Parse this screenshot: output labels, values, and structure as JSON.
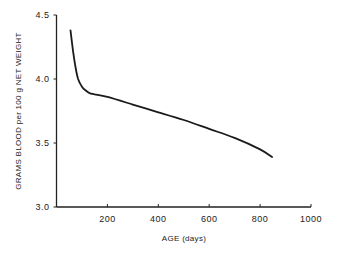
{
  "chart_data": {
    "type": "line",
    "title": "",
    "xlabel": "AGE (days)",
    "ylabel": "GRAMS BLOOD per 100 g   NET WEIGHT",
    "xlim": [
      0,
      1000
    ],
    "ylim": [
      3.0,
      4.5
    ],
    "x_ticks": [
      200,
      400,
      600,
      800,
      1000
    ],
    "x_tick_labels": [
      "200",
      "400",
      "600",
      "800",
      "1000"
    ],
    "y_ticks": [
      3.0,
      3.5,
      4.0,
      4.5
    ],
    "y_tick_labels": [
      "3.0",
      "3.5",
      "4.0",
      "4.5"
    ],
    "grid": false,
    "legend": null,
    "series": [
      {
        "name": "Blood volume",
        "x": [
          55,
          65,
          75,
          85,
          100,
          115,
          130,
          150,
          200,
          300,
          400,
          500,
          600,
          700,
          800,
          847
        ],
        "y": [
          4.38,
          4.22,
          4.09,
          4.0,
          3.94,
          3.91,
          3.89,
          3.88,
          3.86,
          3.8,
          3.74,
          3.68,
          3.61,
          3.54,
          3.45,
          3.39
        ]
      }
    ]
  },
  "labels": {
    "xlabel": "AGE (days)",
    "ylabel": "GRAMS BLOOD per 100 g   NET WEIGHT"
  }
}
